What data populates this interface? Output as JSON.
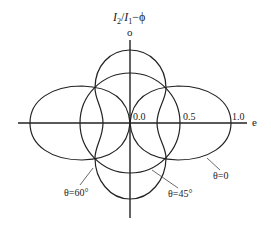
{
  "title": {
    "I2": "I",
    "I2_sub": "2",
    "slash": "/",
    "I1": "I",
    "I1_sub": "1",
    "dash_phi": "−ϕ"
  },
  "axes": {
    "vertical_label": "o",
    "horizontal_label": "e",
    "ticks": [
      "0.0",
      "0.5",
      "1.0"
    ]
  },
  "curves": [
    {
      "name": "theta-0",
      "label": "θ=0",
      "shape": "two horizontal lobes"
    },
    {
      "name": "theta-45",
      "label": "θ=45°",
      "shape": "circle"
    },
    {
      "name": "theta-60",
      "label": "θ=60°",
      "shape": "two vertical lobes / figure-eight"
    }
  ],
  "colors": {
    "line": "#222222",
    "background": "#ffffff"
  }
}
